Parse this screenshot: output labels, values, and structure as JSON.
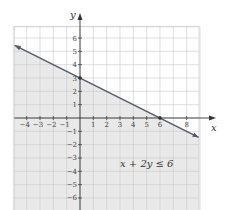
{
  "chart_data": {
    "type": "line",
    "title": "",
    "xlabel": "x",
    "ylabel": "y",
    "xlim": [
      -5,
      9
    ],
    "ylim": [
      -7,
      7
    ],
    "grid": true,
    "x_ticks": [
      -4,
      -3,
      -2,
      -1,
      1,
      2,
      3,
      4,
      5,
      6,
      8
    ],
    "x_tick_labels": [
      "−4",
      "−3",
      "−2",
      "−1",
      "1",
      "2",
      "3",
      "4",
      "5",
      "6",
      "8"
    ],
    "y_ticks": [
      6,
      5,
      4,
      3,
      2,
      1,
      -1,
      -2,
      -3,
      -4,
      -5,
      -6
    ],
    "y_tick_labels": [
      "6",
      "5",
      "4",
      "3",
      "2",
      "1",
      "−1",
      "−2",
      "−3",
      "−4",
      "−5",
      "−6"
    ],
    "series": [
      {
        "name": "x + 2y = 6",
        "x": [
          -4.9,
          0,
          6,
          8.9
        ],
        "y": [
          5.45,
          3,
          0,
          -1.45
        ],
        "style": "solid line with arrows at both ends"
      }
    ],
    "points": [
      {
        "x": 0,
        "y": 3,
        "label": "y-intercept"
      },
      {
        "x": 6,
        "y": 0,
        "label": "x-intercept"
      }
    ],
    "shaded_region": "below the line (x + 2y ≤ 6)",
    "annotations": [
      {
        "text": "x + 2y ≤ 6",
        "x": 5.5,
        "y": -3.7
      }
    ],
    "colors": {
      "shade": "#e9e9e9",
      "grid": "#c9c9c9",
      "line": "#555a66",
      "axis": "#333333"
    }
  },
  "labels": {
    "x_axis": "x",
    "y_axis": "y",
    "inequality": "x + 2y ≤ 6"
  }
}
